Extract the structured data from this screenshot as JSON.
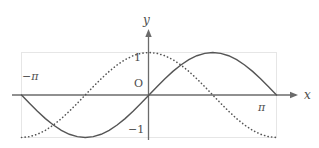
{
  "figure": {
    "background_color": "#ffffff",
    "width": 319,
    "height": 148
  },
  "labels": {
    "y_axis": "y",
    "x_axis": "x",
    "neg_pi": "−π",
    "pi": "π",
    "one": "1",
    "neg_one": "−1",
    "origin": "O"
  },
  "colors": {
    "axis": "#6b6b6b",
    "curve_solid": "#555555",
    "curve_dotted": "#555555",
    "frame": "#e4e4e4",
    "text": "#4d4d4d"
  },
  "chart_data": {
    "type": "line",
    "title": "",
    "xlabel": "x",
    "ylabel": "y",
    "xlim": [
      -3.14159265,
      3.14159265
    ],
    "ylim": [
      -1,
      1
    ],
    "grid": false,
    "legend": "none",
    "xticks": [
      -3.14159265,
      3.14159265
    ],
    "xticklabels": [
      "−π",
      "π"
    ],
    "yticks": [
      -1,
      0,
      1
    ],
    "yticklabels": [
      "−1",
      "O",
      "1"
    ],
    "series": [
      {
        "name": "sin(x)",
        "style": "solid",
        "x": [
          -3.14159265,
          -2.9452431,
          -2.74889357,
          -2.55254403,
          -2.35619449,
          -2.15984495,
          -1.96349541,
          -1.76714587,
          -1.57079633,
          -1.37444679,
          -1.17809725,
          -0.9817477,
          -0.78539816,
          -0.58904862,
          -0.39269908,
          -0.19634954,
          0,
          0.19634954,
          0.39269908,
          0.58904862,
          0.78539816,
          0.9817477,
          1.17809725,
          1.37444679,
          1.57079633,
          1.76714587,
          1.96349541,
          2.15984495,
          2.35619449,
          2.55254403,
          2.74889357,
          2.9452431,
          3.14159265
        ],
        "y": [
          0,
          -0.19509,
          -0.38268,
          -0.55557,
          -0.70711,
          -0.83147,
          -0.92388,
          -0.98079,
          -1,
          -0.98079,
          -0.92388,
          -0.83147,
          -0.70711,
          -0.55557,
          -0.38268,
          -0.19509,
          0,
          0.19509,
          0.38268,
          0.55557,
          0.70711,
          0.83147,
          0.92388,
          0.98079,
          1,
          0.98079,
          0.92388,
          0.83147,
          0.70711,
          0.55557,
          0.38268,
          0.19509,
          0
        ]
      },
      {
        "name": "-cos(x)",
        "style": "dotted",
        "x": [
          -3.14159265,
          -2.9452431,
          -2.74889357,
          -2.55254403,
          -2.35619449,
          -2.15984495,
          -1.96349541,
          -1.76714587,
          -1.57079633,
          -1.37444679,
          -1.17809725,
          -0.9817477,
          -0.78539816,
          -0.58904862,
          -0.39269908,
          -0.19634954,
          0,
          0.19634954,
          0.39269908,
          0.58904862,
          0.78539816,
          0.9817477,
          1.17809725,
          1.37444679,
          1.57079633,
          1.76714587,
          1.96349541,
          2.15984495,
          2.35619449,
          2.55254403,
          2.74889357,
          2.9452431,
          3.14159265
        ],
        "y": [
          -1,
          -0.98079,
          -0.92388,
          -0.83147,
          -0.70711,
          -0.55557,
          -0.38268,
          -0.19509,
          0,
          0.19509,
          0.38268,
          0.55557,
          0.70711,
          0.83147,
          0.92388,
          0.98079,
          1,
          0.98079,
          0.92388,
          0.83147,
          0.70711,
          0.55557,
          0.38268,
          0.19509,
          0,
          -0.19509,
          -0.38268,
          -0.55557,
          -0.70711,
          -0.83147,
          -0.92388,
          -0.98079,
          -1
        ]
      }
    ],
    "annotations": [
      {
        "text": "−π",
        "x": -3.14159265,
        "y": 0,
        "position": "above-left"
      },
      {
        "text": "π",
        "x": 3.14159265,
        "y": 0,
        "position": "below-left"
      },
      {
        "text": "1",
        "x": 0,
        "y": 1,
        "position": "left"
      },
      {
        "text": "−1",
        "x": 0,
        "y": -1,
        "position": "left"
      },
      {
        "text": "O",
        "x": 0,
        "y": 0,
        "position": "above-left"
      }
    ]
  }
}
